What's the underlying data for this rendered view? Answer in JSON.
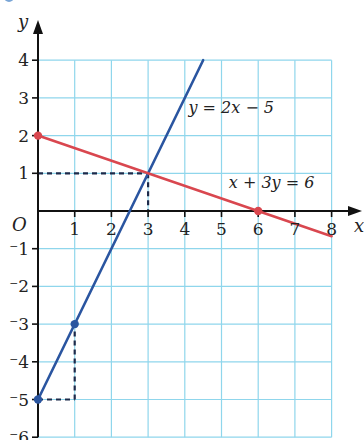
{
  "chart_data": {
    "type": "line",
    "title": "",
    "xlabel": "x",
    "ylabel": "y",
    "origin_label": "O",
    "xlim": [
      0,
      8
    ],
    "ylim": [
      -6,
      4
    ],
    "grid": true,
    "x_ticks": [
      "1",
      "2",
      "3",
      "4",
      "5",
      "6",
      "7",
      "8"
    ],
    "y_ticks": [
      {
        "v": 4,
        "label": "4"
      },
      {
        "v": 3,
        "label": "3"
      },
      {
        "v": 2,
        "label": "2"
      },
      {
        "v": 1,
        "label": "1"
      },
      {
        "v": -1,
        "label": "⁻1"
      },
      {
        "v": -2,
        "label": "⁻2"
      },
      {
        "v": -3,
        "label": "⁻3"
      },
      {
        "v": -4,
        "label": "⁻4"
      },
      {
        "v": -5,
        "label": "⁻5"
      },
      {
        "v": -6,
        "label": "⁻6"
      }
    ],
    "series": [
      {
        "name": "y = 2x − 5",
        "color": "#2a55a0",
        "x": [
          0,
          4.5
        ],
        "y": [
          -5,
          4
        ],
        "marked_points": [
          [
            0,
            -5
          ],
          [
            1,
            -3
          ]
        ]
      },
      {
        "name": "x + 3y = 6",
        "color": "#d9474f",
        "x": [
          0,
          8
        ],
        "y": [
          2,
          -0.667
        ],
        "marked_points": [
          [
            0,
            2
          ],
          [
            6,
            0
          ]
        ]
      }
    ],
    "intersection": [
      3,
      1
    ],
    "dashed_guides": [
      {
        "from": [
          0,
          1
        ],
        "to": [
          3,
          1
        ]
      },
      {
        "from": [
          3,
          1
        ],
        "to": [
          3,
          0
        ]
      },
      {
        "from": [
          0,
          -5
        ],
        "to": [
          1,
          -5
        ]
      },
      {
        "from": [
          1,
          -5
        ],
        "to": [
          1,
          -3
        ]
      }
    ],
    "annotations": [
      {
        "text": "y = 2x − 5",
        "at": [
          4.1,
          2.6
        ]
      },
      {
        "text": "x + 3y = 6",
        "at": [
          5.2,
          0.6
        ]
      }
    ],
    "colors": {
      "grid": "#8fd6ec",
      "axis": "#111111"
    }
  }
}
